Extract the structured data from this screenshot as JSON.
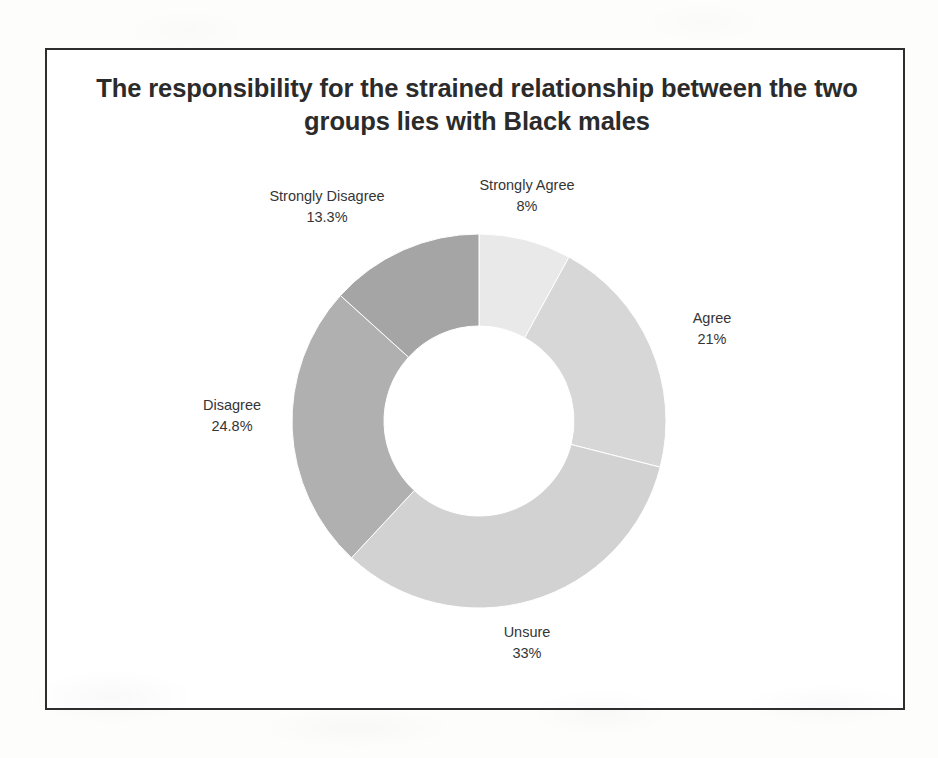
{
  "slide": {
    "title": "The responsibility for the strained relationship between the two groups lies with Black males"
  },
  "chart_data": {
    "type": "pie",
    "variant": "donut",
    "title": "The responsibility for the strained relationship between the two groups lies with Black males",
    "xlabel": "",
    "ylabel": "",
    "legend_position": "none",
    "labels_position": "outside",
    "start_angle_deg": 0,
    "direction": "clockwise",
    "categories": [
      "Strongly Agree",
      "Agree",
      "Unsure",
      "Disagree",
      "Strongly Disagree"
    ],
    "values": [
      8,
      21,
      33,
      24.8,
      13.3
    ],
    "value_labels": [
      "8%",
      "21%",
      "33%",
      "24.8%",
      "13.3%"
    ],
    "colors": [
      "#e9e9e9",
      "#d7d7d7",
      "#d2d2d2",
      "#b0b0b0",
      "#a5a5a5"
    ],
    "slices": [
      {
        "label": "Strongly Agree",
        "value": 8,
        "value_label": "8%",
        "color": "#e9e9e9"
      },
      {
        "label": "Agree",
        "value": 21,
        "value_label": "21%",
        "color": "#d7d7d7"
      },
      {
        "label": "Unsure",
        "value": 33,
        "value_label": "33%",
        "color": "#d2d2d2"
      },
      {
        "label": "Disagree",
        "value": 24.8,
        "value_label": "24.8%",
        "color": "#b0b0b0"
      },
      {
        "label": "Strongly Disagree",
        "value": 13.3,
        "value_label": "13.3%",
        "color": "#a5a5a5"
      }
    ]
  }
}
